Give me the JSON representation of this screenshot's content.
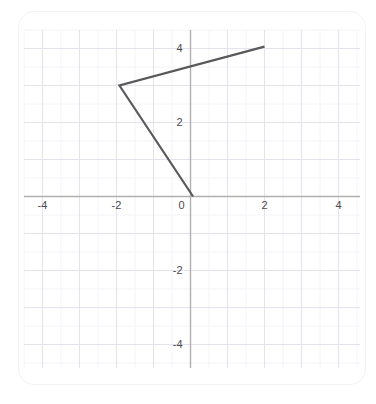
{
  "figure": {
    "background_color": "#ffffff",
    "card_border_color": "#f2f3f7",
    "grid_major_color": "#e2e3ef",
    "grid_minor_color": "#f4f4fa",
    "axis_color": "#b0b0b0",
    "line_color": "#595959",
    "tick_label_color": "#4a4a4a"
  },
  "chart_data": {
    "type": "line",
    "title": "",
    "xlabel": "",
    "ylabel": "",
    "xlim": [
      -4.9,
      4.9
    ],
    "ylim": [
      -4.9,
      4.9
    ],
    "grid": true,
    "grid_major_step": 1,
    "grid_minor_step": 0.5,
    "legend": "none",
    "x_ticks": [
      -4,
      -2,
      0,
      2,
      4
    ],
    "y_ticks": [
      -4,
      -2,
      2,
      4
    ],
    "x_tick_labels": [
      "-4",
      "-2",
      "0",
      "2",
      "4"
    ],
    "y_tick_labels": [
      "-4",
      "-2",
      "2",
      "4"
    ],
    "series": [
      {
        "name": "polyline",
        "points": [
          {
            "x": 2.0,
            "y": 4.05
          },
          {
            "x": -1.92,
            "y": 3.0
          },
          {
            "x": 0.07,
            "y": 0.0
          }
        ]
      }
    ]
  },
  "axes": {
    "x_axis_label": "",
    "y_axis_label": "",
    "origin_label": "0"
  }
}
